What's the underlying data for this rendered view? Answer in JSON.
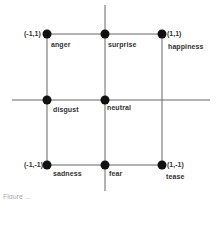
{
  "diagram": {
    "type": "2d emotion grid",
    "axes": {
      "horizontal": {
        "from": -1,
        "to": 1
      },
      "vertical": {
        "from": -1,
        "to": 1
      }
    },
    "corner_coords": {
      "top_left": "(-1,1)",
      "top_right": "(1,1)",
      "bottom_left": "(-1,-1)",
      "bottom_right": "(1,-1)"
    },
    "nodes": [
      {
        "id": "anger",
        "label": "anger",
        "x": -1,
        "y": 1
      },
      {
        "id": "surprise",
        "label": "surprise",
        "x": 0,
        "y": 1
      },
      {
        "id": "happiness",
        "label": "happiness",
        "x": 1,
        "y": 1
      },
      {
        "id": "disgust",
        "label": "disgust",
        "x": -1,
        "y": 0
      },
      {
        "id": "neutral",
        "label": "neutral",
        "x": 0,
        "y": 0
      },
      {
        "id": "sadness",
        "label": "sadness",
        "x": -1,
        "y": -1
      },
      {
        "id": "fear",
        "label": "fear",
        "x": 0,
        "y": -1
      },
      {
        "id": "tease",
        "label": "tease",
        "x": 1,
        "y": -1
      }
    ],
    "colors": {
      "line": "#555555",
      "dot": "#111111",
      "text": "#333333"
    },
    "caption": "Figure ..."
  }
}
